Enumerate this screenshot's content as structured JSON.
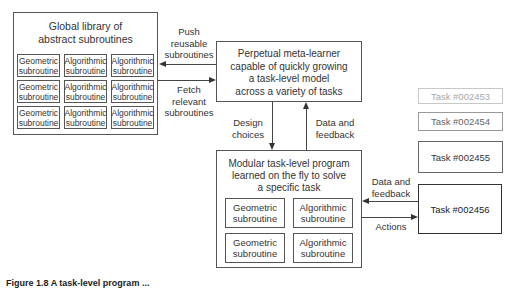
{
  "library": {
    "title_line1": "Global library of",
    "title_line2": "abstract subroutines",
    "grid": [
      [
        "Geometric subroutine",
        "Algorithmic subroutine",
        "Algorithmic subroutine"
      ],
      [
        "Geometric subroutine",
        "Algorithmic subroutine",
        "Algorithmic subroutine"
      ],
      [
        "Geometric subroutine",
        "Algorithmic subroutine",
        "Algorithmic subroutine"
      ]
    ],
    "cells": {
      "r0c0_l1": "Geometric",
      "r0c0_l2": "subroutine",
      "r0c1_l1": "Algorithmic",
      "r0c1_l2": "subroutine",
      "r0c2_l1": "Algorithmic",
      "r0c2_l2": "subroutine",
      "r1c0_l1": "Geometric",
      "r1c0_l2": "subroutine",
      "r1c1_l1": "Algorithmic",
      "r1c1_l2": "subroutine",
      "r1c2_l1": "Algorithmic",
      "r1c2_l2": "subroutine",
      "r2c0_l1": "Geometric",
      "r2c0_l2": "subroutine",
      "r2c1_l1": "Algorithmic",
      "r2c1_l2": "subroutine",
      "r2c2_l1": "Algorithmic",
      "r2c2_l2": "subroutine"
    }
  },
  "meta_learner": {
    "line1": "Perpetual meta-learner",
    "line2": "capable of quickly growing",
    "line3": "a task-level model",
    "line4": "across a variety of tasks"
  },
  "modular_program": {
    "line1": "Modular task-level program",
    "line2": "learned on the fly to solve",
    "line3": "a specific task",
    "cells": {
      "r0c0_l1": "Geometric",
      "r0c0_l2": "subroutine",
      "r0c1_l1": "Algorithmic",
      "r0c1_l2": "subroutine",
      "r1c0_l1": "Geometric",
      "r1c0_l2": "subroutine",
      "r1c1_l1": "Algorithmic",
      "r1c1_l2": "subroutine"
    }
  },
  "edges": {
    "push": {
      "l1": "Push",
      "l2": "reusable",
      "l3": "subroutines"
    },
    "fetch": {
      "l1": "Fetch",
      "l2": "relevant",
      "l3": "subroutines"
    },
    "design": {
      "l1": "Design",
      "l2": "choices"
    },
    "feedback_up": {
      "l1": "Data and",
      "l2": "feedback"
    },
    "feedback_task": {
      "l1": "Data and",
      "l2": "feedback"
    },
    "actions": {
      "l1": "Actions"
    }
  },
  "tasks": [
    {
      "label": "Task #002453",
      "border": "#c8c8c8",
      "text": "#a8a8a8"
    },
    {
      "label": "Task #002454",
      "border": "#999999",
      "text": "#666666"
    },
    {
      "label": "Task #002455",
      "border": "#666666",
      "text": "#333333"
    },
    {
      "label": "Task #002456",
      "border": "#333333",
      "text": "#222222"
    }
  ],
  "caption": "Figure 1.8  A task-level program ..."
}
